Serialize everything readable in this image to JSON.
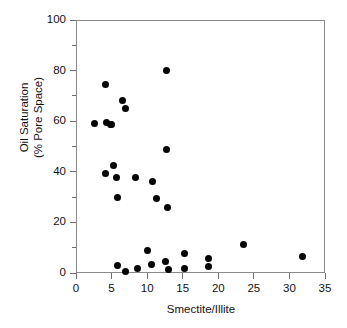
{
  "chart_data": {
    "type": "scatter",
    "title": "",
    "xlabel": "Smectite/Illite",
    "ylabel": "Oil Saturation\n(% Pore Space)",
    "ylabel_line1": "Oil Saturation",
    "ylabel_line2": "(% Pore Space)",
    "xlim": [
      0,
      35
    ],
    "ylim": [
      0,
      100
    ],
    "xticks": [
      0,
      5,
      10,
      15,
      20,
      25,
      30,
      35
    ],
    "xtick_labels": [
      "0",
      "5",
      "10",
      "15",
      "20",
      "25",
      "30",
      "35"
    ],
    "yticks": [
      0,
      20,
      40,
      60,
      80,
      100
    ],
    "ytick_labels": [
      "0",
      "20",
      "40",
      "60",
      "80",
      "100"
    ],
    "y_minor_ticks": [
      10,
      30,
      50,
      70,
      90
    ],
    "grid": false,
    "legend": null,
    "marker": "filled-circle",
    "marker_color": "#050505",
    "marker_size": 7,
    "points": [
      {
        "x": 2.6,
        "y": 59.0
      },
      {
        "x": 4.2,
        "y": 74.5
      },
      {
        "x": 4.3,
        "y": 59.5
      },
      {
        "x": 4.8,
        "y": 58.8
      },
      {
        "x": 5.0,
        "y": 58.6
      },
      {
        "x": 6.5,
        "y": 68.2
      },
      {
        "x": 7.0,
        "y": 65.0
      },
      {
        "x": 12.7,
        "y": 80.0
      },
      {
        "x": 12.7,
        "y": 49.0
      },
      {
        "x": 4.2,
        "y": 39.4
      },
      {
        "x": 5.3,
        "y": 42.5
      },
      {
        "x": 5.7,
        "y": 37.7
      },
      {
        "x": 5.9,
        "y": 29.9
      },
      {
        "x": 8.3,
        "y": 37.8
      },
      {
        "x": 10.8,
        "y": 36.0
      },
      {
        "x": 11.3,
        "y": 29.5
      },
      {
        "x": 12.9,
        "y": 25.8
      },
      {
        "x": 5.9,
        "y": 3.0
      },
      {
        "x": 6.9,
        "y": 0.7
      },
      {
        "x": 8.7,
        "y": 1.7
      },
      {
        "x": 10.0,
        "y": 9.0
      },
      {
        "x": 10.6,
        "y": 3.2
      },
      {
        "x": 12.6,
        "y": 4.7
      },
      {
        "x": 13.0,
        "y": 1.2
      },
      {
        "x": 15.2,
        "y": 7.7
      },
      {
        "x": 15.2,
        "y": 1.8
      },
      {
        "x": 18.6,
        "y": 5.9
      },
      {
        "x": 18.6,
        "y": 2.5
      },
      {
        "x": 23.5,
        "y": 11.1
      },
      {
        "x": 31.9,
        "y": 6.5
      }
    ],
    "geometry": {
      "plot_left": 76,
      "plot_top": 20,
      "plot_width": 249,
      "plot_height": 253
    }
  }
}
